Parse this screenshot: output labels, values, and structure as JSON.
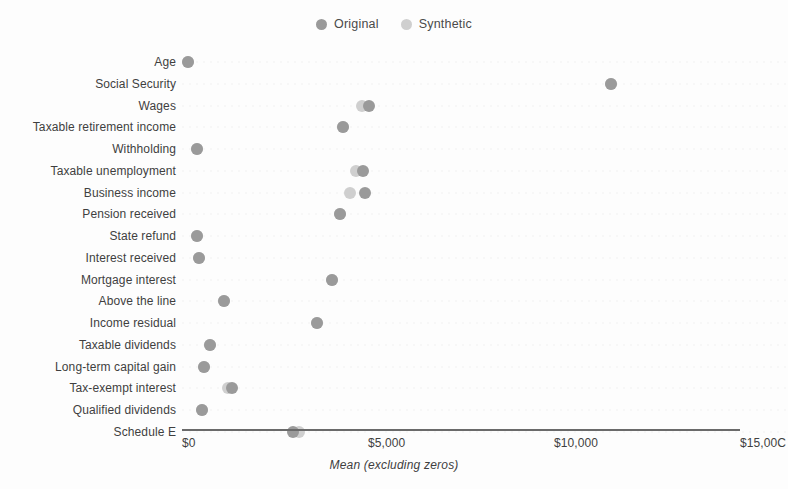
{
  "chart_data": {
    "type": "scatter",
    "title": "",
    "xlabel": "Mean (excluding zeros)",
    "ylabel": "",
    "orientation": "horizontal",
    "grid": true,
    "grid_style": "dotted-rows",
    "legend_position": "top-center",
    "xlim": [
      0,
      15000
    ],
    "xticks": [
      0,
      5000,
      10000,
      15000
    ],
    "xtick_labels": [
      "$0",
      "$5,000",
      "$10,000",
      "$15,000"
    ],
    "xtick_last_clipped": "$15,00C",
    "categories": [
      "Age",
      "Social Security",
      "Wages",
      "Taxable retirement income",
      "Withholding",
      "Taxable unemployment",
      "Business income",
      "Pension received",
      "State refund",
      "Interest received",
      "Mortgage interest",
      "Above the line",
      "Income residual",
      "Taxable dividends",
      "Long-term capital gain",
      "Tax-exempt interest",
      "Qualified dividends",
      "Schedule E"
    ],
    "series": [
      {
        "name": "Original",
        "color": "#9a9a9a",
        "values": [
          170,
          11520,
          5030,
          4340,
          410,
          4860,
          4920,
          4250,
          400,
          470,
          4040,
          1140,
          3620,
          750,
          590,
          1350,
          540,
          2980
        ]
      },
      {
        "name": "Synthetic",
        "color": "#cfcfcf",
        "values": [
          165,
          11520,
          4850,
          4340,
          410,
          4690,
          4510,
          4250,
          400,
          470,
          4040,
          1140,
          3620,
          750,
          590,
          1230,
          540,
          3150
        ]
      }
    ]
  },
  "legend": {
    "items": [
      {
        "label": "Original",
        "color": "#9a9a9a"
      },
      {
        "label": "Synthetic",
        "color": "#cfcfcf"
      }
    ]
  },
  "axis": {
    "x_title": "Mean (excluding zeros)"
  }
}
